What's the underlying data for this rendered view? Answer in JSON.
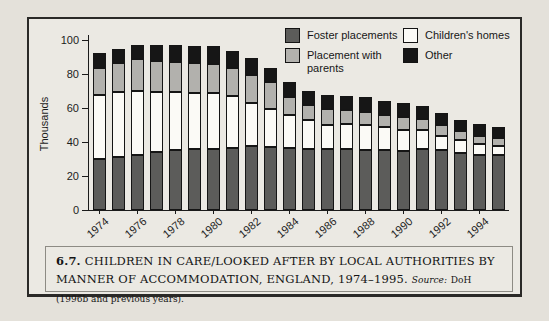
{
  "figure": {
    "number": "6.7.",
    "title": "CHILDREN IN CARE/LOOKED AFTER BY LOCAL AUTHORITIES BY MANNER OF ACCOMMODATION, ENGLAND, 1974–1995.",
    "source_label": "Source:",
    "source_text": "DoH (1996b and previous years)."
  },
  "chart_data": {
    "type": "bar",
    "stacked": true,
    "title": "",
    "xlabel": "",
    "ylabel": "Thousands",
    "units": "thousands",
    "ylim": [
      0,
      100
    ],
    "yticks": [
      0,
      20,
      40,
      60,
      80,
      100
    ],
    "grid": false,
    "legend_position": "top-right",
    "legend_columns": 2,
    "categories": [
      "1974",
      "1975",
      "1976",
      "1977",
      "1978",
      "1979",
      "1980",
      "1981",
      "1982",
      "1983",
      "1984",
      "1985",
      "1986",
      "1987",
      "1988",
      "1989",
      "1990",
      "1991",
      "1992",
      "1993",
      "1994",
      "1995"
    ],
    "xtick_labels": [
      "1974",
      "1976",
      "1978",
      "1980",
      "1982",
      "1984",
      "1986",
      "1988",
      "1990",
      "1992",
      "1994"
    ],
    "series": [
      {
        "name": "Foster placements",
        "color": "#5c5c5a",
        "values": [
          30,
          31,
          32,
          34,
          35,
          35.5,
          36,
          36.5,
          37.5,
          37,
          36.5,
          36,
          35.5,
          35.5,
          35,
          35,
          34.5,
          35.5,
          35,
          33.5,
          32.5,
          32.5
        ]
      },
      {
        "name": "Children's homes",
        "color": "#fbfaf6",
        "values": [
          37.5,
          38,
          38,
          35.5,
          34,
          33,
          32.5,
          30.5,
          25.5,
          22,
          19,
          16.5,
          14.5,
          15,
          15,
          13.5,
          12.5,
          11.5,
          8.5,
          7.5,
          6,
          5
        ]
      },
      {
        "name": "Placement with parents",
        "color": "#b2b1ad",
        "values": [
          16,
          17,
          18.5,
          18,
          18,
          17.5,
          17,
          16.5,
          16,
          16,
          10.5,
          9,
          9.5,
          8,
          7.5,
          7.5,
          7.5,
          6.5,
          6.5,
          5.5,
          5,
          4.5
        ]
      },
      {
        "name": "Other",
        "color": "#161616",
        "values": [
          8.5,
          8.5,
          8,
          9.5,
          9.5,
          10,
          10.5,
          10,
          10,
          8.5,
          9,
          8.5,
          8,
          8.5,
          9,
          8,
          8,
          7.5,
          7,
          6.5,
          7,
          6.5
        ]
      }
    ]
  }
}
